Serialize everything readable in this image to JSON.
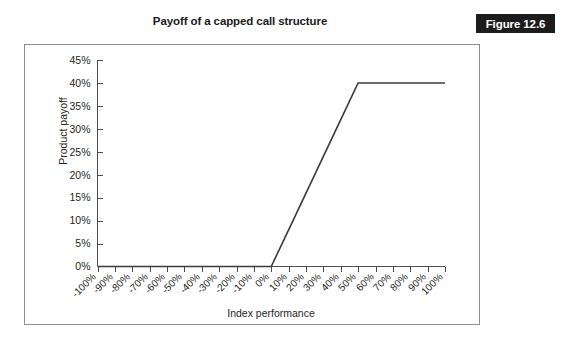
{
  "figure": {
    "badge_label": "Figure 12.6",
    "badge_bg": "#1c1c1c",
    "badge_fg": "#ffffff",
    "border_color": "#8d8d8d"
  },
  "chart_data": {
    "type": "line",
    "title": "Payoff of a capped call structure",
    "xlabel": "Index performance",
    "ylabel": "Product payoff",
    "xlim": [
      -100,
      100
    ],
    "ylim": [
      0,
      45
    ],
    "grid": false,
    "legend": "none",
    "line_color": "#3a3a3a",
    "axis_color": "#4d4d4d",
    "x_tick_labels": [
      "-100%",
      "-90%",
      "-80%",
      "-70%",
      "-60%",
      "-50%",
      "-40%",
      "-30%",
      "-20%",
      "-10%",
      "0%",
      "10%",
      "20%",
      "30%",
      "40%",
      "50%",
      "60%",
      "70%",
      "80%",
      "90%",
      "100%"
    ],
    "x_tick_values": [
      -100,
      -90,
      -80,
      -70,
      -60,
      -50,
      -40,
      -30,
      -20,
      -10,
      0,
      10,
      20,
      30,
      40,
      50,
      60,
      70,
      80,
      90,
      100
    ],
    "y_tick_labels": [
      "0%",
      "5%",
      "10%",
      "15%",
      "20%",
      "25%",
      "30%",
      "35%",
      "40%",
      "45%"
    ],
    "y_tick_values": [
      0,
      5,
      10,
      15,
      20,
      25,
      30,
      35,
      40,
      45
    ],
    "series": [
      {
        "name": "Capped call payoff",
        "x": [
          -100,
          -90,
          -80,
          -70,
          -60,
          -50,
          -40,
          -30,
          -20,
          -10,
          0,
          10,
          20,
          30,
          40,
          50,
          60,
          70,
          80,
          90,
          100
        ],
        "values": [
          0,
          0,
          0,
          0,
          0,
          0,
          0,
          0,
          0,
          0,
          0,
          8,
          16,
          24,
          32,
          40,
          40,
          40,
          40,
          40,
          40
        ]
      }
    ],
    "annotations": {
      "strike": 0,
      "cap_level": 50,
      "cap_payoff": 40,
      "participation": 0.8
    }
  }
}
